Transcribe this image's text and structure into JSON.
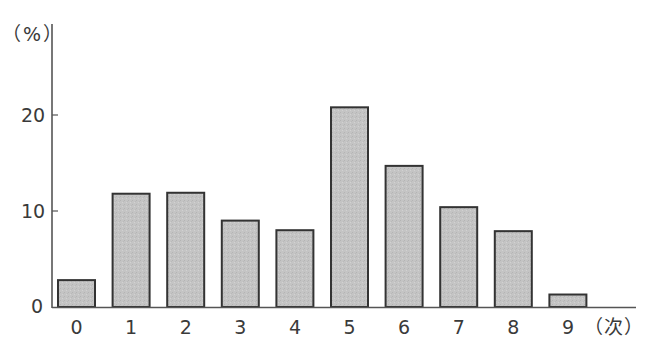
{
  "chart_data": {
    "type": "bar",
    "title": "",
    "xlabel": "（次）",
    "ylabel": "（%）",
    "categories": [
      "0",
      "1",
      "2",
      "3",
      "4",
      "5",
      "6",
      "7",
      "8",
      "9"
    ],
    "values": [
      2.8,
      11.8,
      11.9,
      9.0,
      8.0,
      20.8,
      14.7,
      10.4,
      7.9,
      1.3
    ],
    "yticks": [
      "0",
      "10",
      "20"
    ],
    "ylim": [
      0,
      25
    ],
    "grid": false,
    "legend": null,
    "bar_fill": "#c8c8c8",
    "bar_stroke": "#333333"
  }
}
